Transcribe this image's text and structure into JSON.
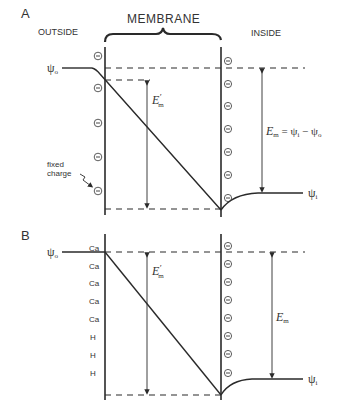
{
  "panel_a": {
    "letter": "A",
    "outside_label": "OUTSIDE",
    "membrane_label": "MEMBRANE",
    "inside_label": "INSIDE",
    "psi_o": "ψo",
    "psi_o_main": "ψ",
    "psi_o_sub": "o",
    "psi_i_main": "ψ",
    "psi_i_sub": "i",
    "em_prime_main": "E",
    "em_prime_sup": "′",
    "em_prime_sub": "m",
    "em_eq_main": "E",
    "em_eq_sub": "m",
    "em_eq_rhs": " = ψ",
    "em_eq_rhs_sub1": "i",
    "em_eq_minus": " − ψ",
    "em_eq_rhs_sub2": "o",
    "fixed_charge_line1": "fixed",
    "fixed_charge_line2": "charge",
    "outer_charges": [
      "⊖",
      "⊖",
      "⊖",
      "⊖",
      "⊖"
    ],
    "inner_charges": [
      "⊖",
      "⊖",
      "⊖",
      "⊖",
      "⊖",
      "⊖",
      "⊖",
      "⊖"
    ]
  },
  "panel_b": {
    "letter": "B",
    "psi_o_main": "ψ",
    "psi_o_sub": "o",
    "psi_i_main": "ψ",
    "psi_i_sub": "i",
    "em_prime_main": "E",
    "em_prime_sup": "′",
    "em_prime_sub": "m",
    "em_main": "E",
    "em_sub": "m",
    "outer_ions": [
      "Ca",
      "Ca",
      "Ca",
      "Ca",
      "Ca",
      "H",
      "H",
      "H"
    ],
    "inner_charges": [
      "⊖",
      "⊖",
      "⊖",
      "⊖",
      "⊖",
      "⊖",
      "⊖",
      "⊖"
    ]
  },
  "colors": {
    "line": "#2a2a2a",
    "text": "#333333",
    "background": "#ffffff"
  }
}
